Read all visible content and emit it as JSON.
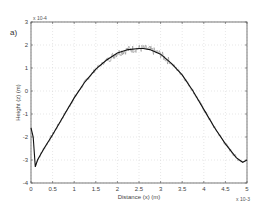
{
  "panel_label": "a)",
  "chart_data": {
    "type": "line",
    "title": "",
    "xlabel": "Distance (x) (m)",
    "ylabel": "Height (z) (m)",
    "x_multiplier": "x 10^-3",
    "y_multiplier": "x 10^-4",
    "xlim": [
      0,
      5
    ],
    "ylim": [
      -4,
      3
    ],
    "x_ticks": [
      "0",
      "0.5",
      "1",
      "1.5",
      "2",
      "2.5",
      "3",
      "3.5",
      "4",
      "4.5",
      "5"
    ],
    "y_ticks": [
      "-4",
      "-3",
      "-2",
      "-1",
      "0",
      "1",
      "2",
      "3"
    ],
    "grid": true,
    "legend": null,
    "series": [
      {
        "name": "measured profile (noisy)",
        "x": [
          0,
          0.05,
          0.1,
          0.15,
          0.3,
          0.5,
          0.75,
          1.0,
          1.25,
          1.5,
          1.75,
          2.0,
          2.25,
          2.5,
          2.6,
          2.75,
          3.0,
          3.25,
          3.5,
          3.75,
          4.0,
          4.25,
          4.5,
          4.75,
          4.9,
          5.0
        ],
        "y": [
          -1.6,
          -2.0,
          -3.3,
          -3.0,
          -2.5,
          -1.9,
          -1.1,
          -0.3,
          0.4,
          0.95,
          1.35,
          1.65,
          1.8,
          1.85,
          1.85,
          1.8,
          1.6,
          1.2,
          0.7,
          0.0,
          -0.8,
          -1.6,
          -2.3,
          -2.9,
          -3.1,
          -3.0
        ]
      }
    ]
  }
}
